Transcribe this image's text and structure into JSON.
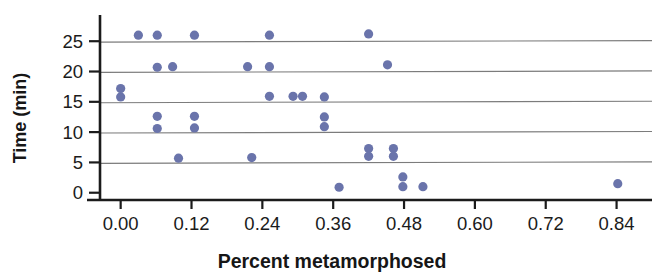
{
  "chart_data": {
    "type": "scatter",
    "title": "",
    "xlabel": "Percent metamorphosed",
    "ylabel": "Time (min)",
    "xlim": [
      -0.035,
      0.9
    ],
    "ylim": [
      -1.2,
      28.5
    ],
    "xticks": [
      0.0,
      0.12,
      0.24,
      0.36,
      0.48,
      0.6,
      0.72,
      0.84
    ],
    "xtick_labels": [
      "0.00",
      "0.12",
      "0.24",
      "0.36",
      "0.48",
      "0.60",
      "0.72",
      "0.84"
    ],
    "yticks": [
      0,
      5,
      10,
      15,
      20,
      25
    ],
    "ytick_labels": [
      "0",
      "5",
      "10",
      "15",
      "20",
      "25"
    ],
    "grid": "horizontal",
    "grid_color": "#7c7c7c",
    "marker_color": "#6a74ab",
    "marker_size": 6,
    "axis_color": "#1b1b1b",
    "legend": null,
    "points": [
      {
        "x": 0.0,
        "y": 17.2
      },
      {
        "x": 0.0,
        "y": 15.8
      },
      {
        "x": 0.03,
        "y": 26.0
      },
      {
        "x": 0.062,
        "y": 26.0
      },
      {
        "x": 0.062,
        "y": 20.7
      },
      {
        "x": 0.062,
        "y": 12.6
      },
      {
        "x": 0.062,
        "y": 10.6
      },
      {
        "x": 0.088,
        "y": 20.8
      },
      {
        "x": 0.098,
        "y": 5.7
      },
      {
        "x": 0.125,
        "y": 26.0
      },
      {
        "x": 0.125,
        "y": 12.6
      },
      {
        "x": 0.125,
        "y": 10.7
      },
      {
        "x": 0.215,
        "y": 20.8
      },
      {
        "x": 0.222,
        "y": 5.8
      },
      {
        "x": 0.252,
        "y": 26.0
      },
      {
        "x": 0.252,
        "y": 20.8
      },
      {
        "x": 0.252,
        "y": 15.9
      },
      {
        "x": 0.292,
        "y": 15.9
      },
      {
        "x": 0.308,
        "y": 15.9
      },
      {
        "x": 0.345,
        "y": 15.8
      },
      {
        "x": 0.345,
        "y": 12.5
      },
      {
        "x": 0.345,
        "y": 10.9
      },
      {
        "x": 0.37,
        "y": 0.9
      },
      {
        "x": 0.42,
        "y": 26.2
      },
      {
        "x": 0.42,
        "y": 7.3
      },
      {
        "x": 0.42,
        "y": 6.0
      },
      {
        "x": 0.452,
        "y": 21.1
      },
      {
        "x": 0.462,
        "y": 7.3
      },
      {
        "x": 0.462,
        "y": 6.0
      },
      {
        "x": 0.478,
        "y": 2.6
      },
      {
        "x": 0.478,
        "y": 1.0
      },
      {
        "x": 0.512,
        "y": 1.0
      },
      {
        "x": 0.842,
        "y": 1.5
      }
    ]
  },
  "axes": {
    "x_title": "Percent metamorphosed",
    "y_title": "Time (min)"
  }
}
